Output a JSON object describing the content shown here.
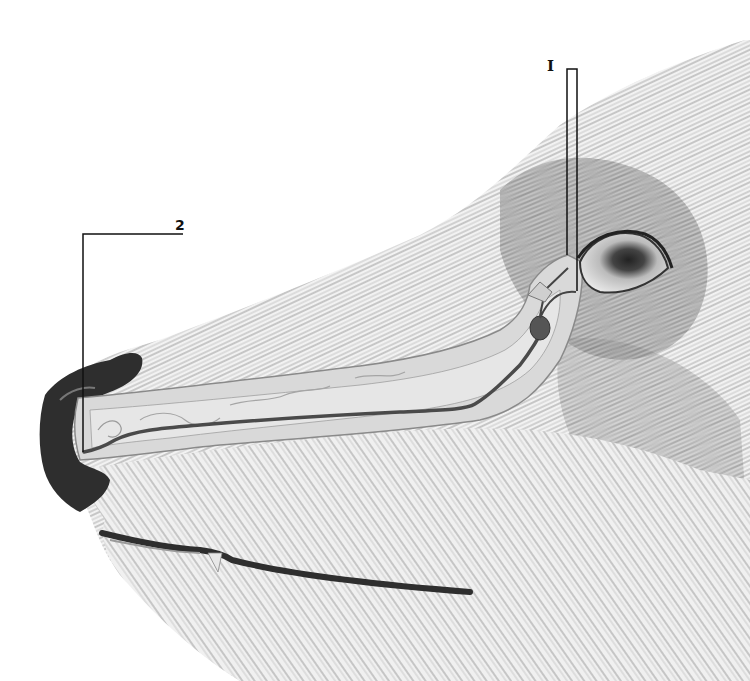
{
  "illustration": {
    "subject": "Sagittal cut-away of a canine/wolf muzzle showing the nasolacrimal duct",
    "labels": [
      {
        "id": "1",
        "text": "I",
        "points_to": "lacrimal sac / puncta near the medial eye corner"
      },
      {
        "id": "2",
        "text": "2",
        "points_to": "nasal opening of the duct at the nostril"
      }
    ],
    "colors": {
      "background": "#ffffff",
      "fur_dark": "#3a3a3a",
      "fur_mid": "#8a8a8a",
      "cutaway_fill": "#d8d8d8",
      "duct_line": "#555555",
      "nose": "#2a2a2a",
      "leader_line": "#111111"
    }
  }
}
